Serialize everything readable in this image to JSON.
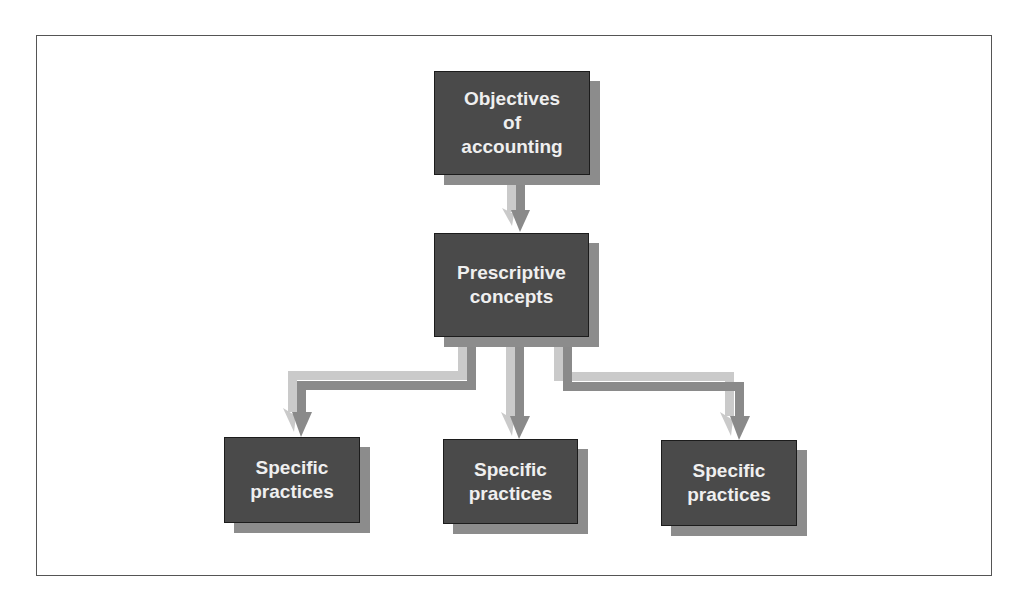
{
  "diagram": {
    "colors": {
      "box_fill": "#4a4a4a",
      "box_shadow": "#8c8c8c",
      "box_text": "#efefef",
      "arrow_light": "#cacaca",
      "arrow_dark": "#8a8a8a",
      "frame_border": "#555555"
    },
    "nodes": {
      "objectives": {
        "label": "Objectives\nof\naccounting"
      },
      "prescriptive": {
        "label": "Prescriptive\nconcepts"
      },
      "practices_left": {
        "label": "Specific\npractices"
      },
      "practices_middle": {
        "label": "Specific\npractices"
      },
      "practices_right": {
        "label": "Specific\npractices"
      }
    },
    "edges": [
      {
        "from": "objectives",
        "to": "prescriptive"
      },
      {
        "from": "prescriptive",
        "to": "practices_left"
      },
      {
        "from": "prescriptive",
        "to": "practices_middle"
      },
      {
        "from": "prescriptive",
        "to": "practices_right"
      }
    ]
  }
}
